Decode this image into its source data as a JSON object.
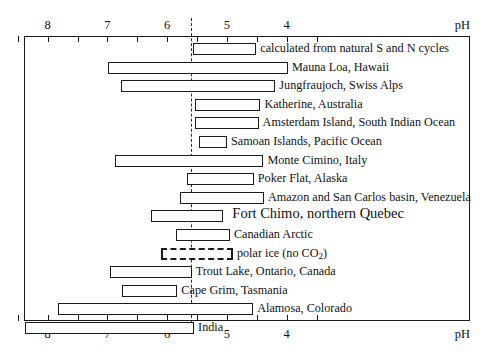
{
  "chart_data": {
    "type": "bar",
    "orientation": "horizontal-range",
    "title": "",
    "xlabel": "pH",
    "ylabel": "",
    "xlim": [
      8.4,
      3.6
    ],
    "axis_reversed": true,
    "grid": false,
    "legend": "none",
    "axis_caption_top": "pH",
    "axis_caption_bottom": "pH",
    "tick_labels": [
      "8",
      "7",
      "6",
      "5",
      "4"
    ],
    "tick_values": [
      8,
      7,
      6,
      5,
      4
    ],
    "minor_tick_values": [
      8.5,
      7.5,
      6.5,
      5.5,
      4.5,
      3.5
    ],
    "reference_line_value": 5.6,
    "reference_line_note": "pure rain in equilibrium with atmospheric CO2",
    "categories": [
      "calculated from natural S and N cycles",
      "Mauna Loa, Hawaii",
      "Jungfraujoch, Swiss Alps",
      "Katherine, Australia",
      "Amsterdam Island, South Indian Ocean",
      "Samoan Islands, Pacific Ocean",
      "Monte Cimino, Italy",
      "Poker Flat, Alaska",
      "Amazon and San Carlos basin, Venezuela",
      "Fort Chimo, northern Quebec",
      "Canadian Arctic",
      "polar ice (no CO2)",
      "Trout Lake, Ontario, Canada",
      "Cape Grim, Tasmania",
      "Alamosa, Colorado",
      "India"
    ],
    "ranges": [
      {
        "label": "calculated from natural S and N cycles",
        "ph_high": 5.57,
        "ph_low": 4.51,
        "style": "solid",
        "emphasis": false
      },
      {
        "label": "Mauna Loa, Hawaii",
        "ph_high": 6.99,
        "ph_low": 3.98,
        "style": "solid",
        "emphasis": false
      },
      {
        "label": "Jungfraujoch, Swiss Alps",
        "ph_high": 6.78,
        "ph_low": 4.19,
        "style": "solid",
        "emphasis": false
      },
      {
        "label": "Katherine, Australia",
        "ph_high": 5.54,
        "ph_low": 4.44,
        "style": "solid",
        "emphasis": false
      },
      {
        "label": "Amsterdam Island, South Indian Ocean",
        "ph_high": 5.54,
        "ph_low": 4.47,
        "style": "solid",
        "emphasis": false
      },
      {
        "label": "Samoan Islands, Pacific Ocean",
        "ph_high": 5.47,
        "ph_low": 5.0,
        "style": "solid",
        "emphasis": false
      },
      {
        "label": "Monte Cimino, Italy",
        "ph_high": 6.87,
        "ph_low": 4.39,
        "style": "solid",
        "emphasis": false
      },
      {
        "label": "Poker Flat, Alaska",
        "ph_high": 5.67,
        "ph_low": 4.55,
        "style": "solid",
        "emphasis": false
      },
      {
        "label": "Amazon and San Carlos basin, Venezuela",
        "ph_high": 5.78,
        "ph_low": 4.38,
        "style": "solid",
        "emphasis": false
      },
      {
        "label": "Fort Chimo, northern Quebec",
        "ph_high": 6.27,
        "ph_low": 5.06,
        "style": "solid",
        "emphasis": true
      },
      {
        "label": "Canadian Arctic",
        "ph_high": 5.85,
        "ph_low": 4.95,
        "style": "solid",
        "emphasis": false
      },
      {
        "label": "polar ice (no CO2)",
        "ph_high": 6.1,
        "ph_low": 4.9,
        "style": "dashed",
        "emphasis": false
      },
      {
        "label": "Trout Lake, Ontario, Canada",
        "ph_high": 6.96,
        "ph_low": 5.59,
        "style": "solid",
        "emphasis": false
      },
      {
        "label": "Cape Grim, Tasmania",
        "ph_high": 6.75,
        "ph_low": 5.83,
        "style": "solid",
        "emphasis": false
      },
      {
        "label": "Alamosa, Colorado",
        "ph_high": 7.82,
        "ph_low": 4.56,
        "style": "solid",
        "emphasis": false
      },
      {
        "label": "India",
        "ph_high": 8.38,
        "ph_low": 5.55,
        "style": "solid",
        "emphasis": false
      }
    ]
  }
}
